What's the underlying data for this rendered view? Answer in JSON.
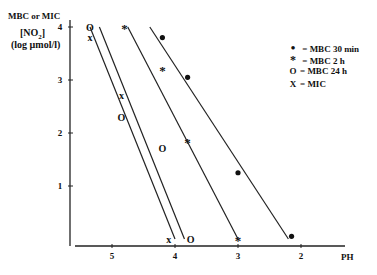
{
  "chart_data": {
    "type": "scatter",
    "title": "",
    "ylabel_lines": [
      "MBC or MIC",
      "[NO2]",
      "(log µmol/l)"
    ],
    "xlabel": "PH",
    "x_ticks": [
      "5",
      "4",
      "3",
      "2"
    ],
    "y_ticks": [
      "1",
      "2",
      "3",
      "4"
    ],
    "xlim": [
      5.6,
      1.5
    ],
    "ylim": [
      0,
      4.1
    ],
    "x_reversed": true,
    "grid": false,
    "legend_position": "right",
    "series": [
      {
        "name": "MBC 30 min",
        "marker": "•",
        "points": [
          [
            4.2,
            3.8
          ],
          [
            3.8,
            3.05
          ],
          [
            3.0,
            1.25
          ],
          [
            2.15,
            0.05
          ]
        ],
        "fit_line": [
          [
            4.4,
            4.0
          ],
          [
            2.2,
            0.0
          ]
        ]
      },
      {
        "name": "MBC 2 h",
        "marker": "*",
        "points": [
          [
            4.8,
            4.0
          ],
          [
            4.2,
            3.2
          ],
          [
            3.8,
            1.85
          ],
          [
            3.0,
            0.0
          ]
        ],
        "fit_line": [
          [
            4.75,
            4.0
          ],
          [
            3.0,
            0.0
          ]
        ]
      },
      {
        "name": "MBC 24 h",
        "marker": "O",
        "points": [
          [
            5.35,
            4.0
          ],
          [
            4.85,
            2.3
          ],
          [
            4.2,
            1.7
          ],
          [
            3.75,
            0.0
          ]
        ],
        "fit_line": [
          [
            5.2,
            4.0
          ],
          [
            3.85,
            0.0
          ]
        ]
      },
      {
        "name": "MIC",
        "marker": "X",
        "points": [
          [
            5.35,
            3.8
          ],
          [
            4.85,
            2.7
          ],
          [
            4.1,
            0.0
          ]
        ],
        "fit_line": [
          [
            5.35,
            4.0
          ],
          [
            4.0,
            0.0
          ]
        ]
      }
    ]
  },
  "axis": {
    "ylabel_1": "MBC or MIC",
    "ylabel_2": "[NO",
    "ylabel_2_sub": "2",
    "ylabel_2_end": "]",
    "ylabel_3": "(log µmol/l)",
    "xlabel": "PH"
  },
  "legend": [
    {
      "symbol": "•",
      "label": "= MBC 30 min"
    },
    {
      "symbol": "*",
      "label": "= MBC 2 h"
    },
    {
      "symbol": "O",
      "label": "= MBC 24 h"
    },
    {
      "symbol": "X",
      "label": "= MIC"
    }
  ]
}
